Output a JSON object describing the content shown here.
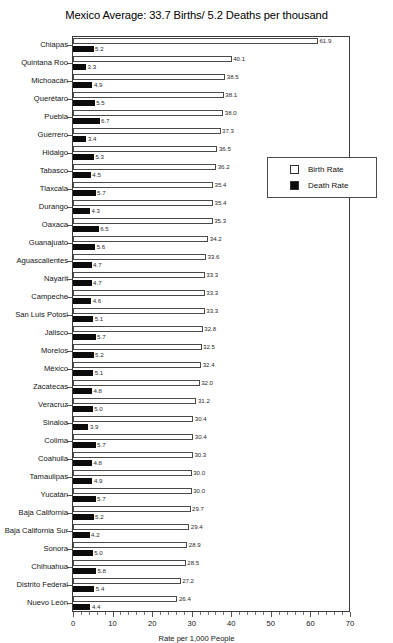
{
  "chart_data": {
    "type": "bar",
    "orientation": "horizontal",
    "title": "Mexico Average: 33.7 Births/ 5.2 Deaths per thousand",
    "xlabel": "Rate per 1,000 People",
    "ylabel": "",
    "xlim": [
      0,
      70
    ],
    "xticks": [
      0,
      10,
      20,
      30,
      40,
      50,
      60,
      70
    ],
    "xticklabels": [
      "0",
      "10",
      "20",
      "30",
      "40",
      "50",
      "60",
      "70"
    ],
    "grid": false,
    "legend_position": "upper right",
    "categories": [
      "Chiapas",
      "Quintana Roo",
      "Michoacán",
      "Querétaro",
      "Puebla",
      "Guerrero",
      "Hidalgo",
      "Tabasco",
      "Tlaxcala",
      "Durango",
      "Oaxaca",
      "Guanajuato",
      "Aguascalientes",
      "Nayarit",
      "Campeche",
      "San Luis Potosi",
      "Jalisco",
      "Morelos",
      "México",
      "Zacatecas",
      "Veracruz",
      "Sinaloa",
      "Colima",
      "Coahuila",
      "Tamaulipas",
      "Yucatán",
      "Baja California",
      "Baja California Sur",
      "Sonora",
      "Chihuahua",
      "Distrito Federal",
      "Nuevo León"
    ],
    "series": [
      {
        "name": "Birth Rate",
        "color": "#ffffff",
        "values": [
          61.9,
          40.1,
          38.5,
          38.1,
          38.0,
          37.3,
          36.5,
          36.2,
          35.4,
          35.4,
          35.3,
          34.2,
          33.6,
          33.3,
          33.3,
          33.3,
          32.8,
          32.5,
          32.4,
          32.0,
          31.2,
          30.4,
          30.4,
          30.3,
          30.0,
          30.0,
          29.7,
          29.4,
          28.9,
          28.5,
          27.2,
          26.4
        ],
        "labels": [
          "61.9",
          "40.1",
          "38.5",
          "38.1",
          "38.0",
          "37.3",
          "36.5",
          "36.2",
          "35.4",
          "35.4",
          "35.3",
          "34.2",
          "33.6",
          "33.3",
          "33.3",
          "33.3",
          "32.8",
          "32.5",
          "32.4",
          "32.0",
          "31.2",
          "30.4",
          "30.4",
          "30.3",
          "30.0",
          "30.0",
          "29.7",
          "29.4",
          "28.9",
          "28.5",
          "27.2",
          "26.4"
        ]
      },
      {
        "name": "Death Rate",
        "color": "#0c0c0c",
        "values": [
          5.2,
          3.3,
          4.9,
          5.5,
          6.7,
          3.4,
          5.3,
          4.5,
          5.7,
          4.3,
          6.5,
          5.6,
          4.7,
          4.7,
          4.6,
          5.1,
          5.7,
          5.2,
          5.1,
          4.8,
          5.0,
          3.9,
          5.7,
          4.8,
          4.9,
          5.7,
          5.2,
          4.2,
          5.0,
          5.8,
          5.4,
          4.4
        ],
        "labels": [
          "5.2",
          "3.3",
          "4.9",
          "5.5",
          "6.7",
          "3.4",
          "5.3",
          "4.5",
          "5.7",
          "4.3",
          "6.5",
          "5.6",
          "4.7",
          "4.7",
          "4.6",
          "5.1",
          "5.7",
          "5.2",
          "5.1",
          "4.8",
          "5.0",
          "3.9",
          "5.7",
          "4.8",
          "4.9",
          "5.7",
          "5.2",
          "4.2",
          "5.0",
          "5.8",
          "5.4",
          "4.4"
        ]
      }
    ],
    "legend": [
      {
        "label": "Birth Rate",
        "swatch": "#ffffff"
      },
      {
        "label": "Death Rate",
        "swatch": "#0c0c0c"
      }
    ]
  }
}
